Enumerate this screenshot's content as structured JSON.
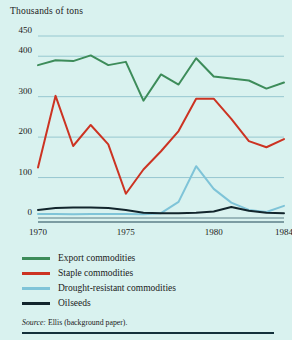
{
  "chart_data": {
    "type": "line",
    "title": "Thousands of tons",
    "xlabel": "",
    "ylabel": "Thousands of tons",
    "xlim": [
      1970,
      1984
    ],
    "ylim": [
      0,
      450
    ],
    "yticks": [
      0,
      100,
      200,
      300,
      400,
      450
    ],
    "ytick_labels": [
      "0",
      "100",
      "200",
      "300",
      "400",
      "450"
    ],
    "xticks": [
      1970,
      1975,
      1980,
      1984
    ],
    "xtick_labels": [
      "1970",
      "1975",
      "1980",
      "1984"
    ],
    "grid": true,
    "legend_position": "below",
    "x": [
      1970,
      1971,
      1972,
      1973,
      1974,
      1975,
      1976,
      1977,
      1978,
      1979,
      1980,
      1981,
      1982,
      1983,
      1984
    ],
    "series": [
      {
        "name": "Export commodities",
        "color": "#3d8c5a",
        "values": [
          378,
          390,
          388,
          402,
          378,
          386,
          290,
          355,
          330,
          395,
          350,
          345,
          340,
          320,
          335
        ]
      },
      {
        "name": "Staple commodities",
        "color": "#cc3322",
        "values": [
          125,
          302,
          178,
          230,
          182,
          60,
          120,
          165,
          215,
          295,
          295,
          245,
          190,
          175,
          195
        ]
      },
      {
        "name": "Drought-resistant commodities",
        "color": "#7fc4d8",
        "values": [
          10,
          10,
          9,
          10,
          10,
          10,
          9,
          12,
          40,
          128,
          72,
          38,
          20,
          15,
          30
        ]
      },
      {
        "name": "Oilseeds",
        "color": "#12252c",
        "values": [
          20,
          25,
          26,
          26,
          25,
          20,
          13,
          12,
          12,
          13,
          16,
          27,
          18,
          13,
          12
        ]
      }
    ]
  },
  "axis_title": "Thousands of tons",
  "legend": {
    "items": [
      {
        "label": "Export commodities",
        "color": "#3d8c5a"
      },
      {
        "label": "Staple commodities",
        "color": "#cc3322"
      },
      {
        "label": "Drought-resistant commodities",
        "color": "#7fc4d8"
      },
      {
        "label": "Oilseeds",
        "color": "#12252c"
      }
    ]
  },
  "source": {
    "prefix": "Source:",
    "text": "Ellis (background paper)."
  }
}
